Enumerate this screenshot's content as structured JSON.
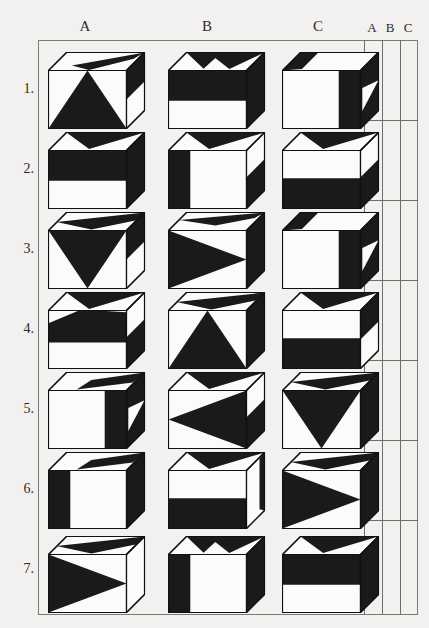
{
  "headers": {
    "columns": [
      "A",
      "B",
      "C"
    ],
    "answer_columns": [
      "A",
      "B",
      "C"
    ]
  },
  "rows": [
    {
      "number": "1.",
      "cubes": [
        {
          "id": "1A",
          "front": "triangle-up",
          "top": "right-black-band",
          "right": "upper-black"
        },
        {
          "id": "1B",
          "front": "upper-half-black",
          "top": "double-black-wedge",
          "right": "black"
        },
        {
          "id": "1C",
          "front": "right-black-strip",
          "top": "left-black-corner",
          "right": "black-with-white-notch"
        }
      ]
    },
    {
      "number": "2.",
      "cubes": [
        {
          "id": "2A",
          "front": "upper-half-black",
          "top": "black-wedge",
          "right": "black"
        },
        {
          "id": "2B",
          "front": "left-black-strip",
          "top": "black-wedge",
          "right": "lower-black"
        },
        {
          "id": "2C",
          "front": "lower-half-black",
          "top": "black-wedge",
          "right": "lower-black"
        }
      ]
    },
    {
      "number": "3.",
      "cubes": [
        {
          "id": "3A",
          "front": "triangle-down",
          "top": "black-band",
          "right": "upper-black"
        },
        {
          "id": "3B",
          "front": "triangle-right",
          "top": "thin-black-band",
          "right": "black"
        },
        {
          "id": "3C",
          "front": "right-black-strip",
          "top": "left-black-corner",
          "right": "black-with-white-notch"
        }
      ]
    },
    {
      "number": "4.",
      "cubes": [
        {
          "id": "4A",
          "front": "upper-black-slanted",
          "top": "black-wedge",
          "right": "lower-black"
        },
        {
          "id": "4B",
          "front": "triangle-up",
          "top": "black-band",
          "right": "black"
        },
        {
          "id": "4C",
          "front": "lower-half-black",
          "top": "black-wedge",
          "right": "upper-black"
        }
      ]
    },
    {
      "number": "5.",
      "cubes": [
        {
          "id": "5A",
          "front": "right-black-strip",
          "top": "right-black-wedge",
          "right": "black-with-white-notch"
        },
        {
          "id": "5B",
          "front": "triangle-left",
          "top": "black-wedge",
          "right": "lower-black"
        },
        {
          "id": "5C",
          "front": "triangle-down",
          "top": "black-band",
          "right": "black"
        }
      ]
    },
    {
      "number": "6.",
      "cubes": [
        {
          "id": "6A",
          "front": "left-black-strip",
          "top": "right-black-wedge",
          "right": "black"
        },
        {
          "id": "6B",
          "front": "lower-half-black",
          "top": "black-wedge",
          "right": "white-with-black-edge"
        },
        {
          "id": "6C",
          "front": "triangle-right",
          "top": "black-band",
          "right": "black"
        }
      ]
    },
    {
      "number": "7.",
      "cubes": [
        {
          "id": "7A",
          "front": "triangle-right",
          "top": "black-band",
          "right": "white"
        },
        {
          "id": "7B",
          "front": "left-black-strip",
          "top": "double-black-wedge",
          "right": "black"
        },
        {
          "id": "7C",
          "front": "upper-half-black",
          "top": "black-wedge",
          "right": "black"
        }
      ]
    }
  ],
  "colors": {
    "page_background": "#f2f1ef",
    "ink": "#111111",
    "frame_line": "#7d7b77",
    "fill_black": "#1a1a1a",
    "fill_white": "#fbfbf9"
  },
  "layout": {
    "column_header_x": [
      85,
      207,
      318
    ],
    "answer_header_x": [
      372,
      390,
      407
    ],
    "row_centers_y": [
      88,
      168,
      248,
      328,
      408,
      488,
      570
    ]
  }
}
